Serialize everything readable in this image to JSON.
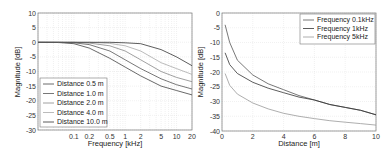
{
  "chart_data": [
    {
      "type": "line",
      "title": "",
      "xlabel": "Frequency [kHz]",
      "ylabel": "Magnitude [dB]",
      "xscale": "log",
      "xlim": [
        0.02,
        20
      ],
      "ylim": [
        -30,
        10
      ],
      "xticks": [
        "0.1",
        "0.2",
        "0.5",
        "1",
        "2",
        "5",
        "10",
        "20"
      ],
      "yticks": [
        "10",
        "5",
        "0",
        "-5",
        "-10",
        "-15",
        "-20",
        "-25",
        "-30"
      ],
      "grid": true,
      "legend_position": "lower left",
      "x": [
        0.02,
        0.05,
        0.1,
        0.2,
        0.5,
        1,
        2,
        5,
        10,
        20
      ],
      "series": [
        {
          "name": "Distance 0.5 m",
          "values": [
            0,
            -0.1,
            -0.5,
            -2,
            -5.5,
            -8.5,
            -11.5,
            -15,
            -16.5,
            -18
          ]
        },
        {
          "name": "Distance 1.0 m",
          "values": [
            0,
            0,
            -0.2,
            -0.8,
            -3,
            -6,
            -9,
            -12.5,
            -14.5,
            -16
          ]
        },
        {
          "name": "Distance 2.0 m",
          "values": [
            0,
            0,
            0,
            -0.3,
            -1.2,
            -3,
            -6,
            -10,
            -12,
            -13.5
          ]
        },
        {
          "name": "Distance 4.0 m",
          "values": [
            0,
            0,
            0,
            0,
            -0.4,
            -1.2,
            -3,
            -7,
            -9,
            -11
          ]
        },
        {
          "name": "Distance 10.0 m",
          "values": [
            0,
            0,
            0,
            0,
            0,
            -0.2,
            -0.5,
            -2.5,
            -5,
            -8
          ]
        }
      ]
    },
    {
      "type": "line",
      "title": "",
      "xlabel": "Distance [m]",
      "ylabel": "Magnitude [dB]",
      "xlim": [
        0,
        10
      ],
      "ylim": [
        -40,
        0
      ],
      "xticks": [
        "0",
        "2",
        "4",
        "6",
        "8",
        "10"
      ],
      "yticks": [
        "0",
        "-5",
        "-10",
        "-15",
        "-20",
        "-25",
        "-30",
        "-35",
        "-40"
      ],
      "grid": true,
      "legend_position": "upper right",
      "x": [
        0.2,
        0.5,
        1,
        2,
        3,
        4,
        5,
        6,
        7,
        8,
        9,
        10
      ],
      "series": [
        {
          "name": "Frequency 0.1kHz",
          "values": [
            -4,
            -10,
            -16,
            -21,
            -24,
            -26,
            -28,
            -29.5,
            -31,
            -32,
            -33,
            -34.5
          ]
        },
        {
          "name": "Frequency 1kHz",
          "values": [
            -13.5,
            -17.5,
            -20.5,
            -23.5,
            -25.5,
            -27,
            -28.5,
            -29.5,
            -31,
            -32,
            -33,
            -34.5
          ]
        },
        {
          "name": "Frequency 5kHz",
          "values": [
            -20.5,
            -24.5,
            -27.5,
            -30.5,
            -32.5,
            -34,
            -35,
            -35.8,
            -36.5,
            -37,
            -37.5,
            -38
          ]
        }
      ]
    }
  ],
  "left": {
    "xlabel": "Frequency [kHz]",
    "ylabel": "Magnitude [dB]",
    "xticks": [
      "0.1",
      "0.2",
      "0.5",
      "1",
      "2",
      "5",
      "10",
      "20"
    ],
    "yticks": [
      "10",
      "5",
      "0",
      "-5",
      "-10",
      "-15",
      "-20",
      "-25",
      "-30"
    ],
    "legend": [
      "Distance 0.5 m",
      "Distance 1.0 m",
      "Distance 2.0 m",
      "Distance 4.0 m",
      "Distance 10.0 m"
    ]
  },
  "right": {
    "xlabel": "Distance [m]",
    "ylabel": "Magnitude [dB]",
    "xticks": [
      "0",
      "2",
      "4",
      "6",
      "8",
      "10"
    ],
    "yticks": [
      "0",
      "-5",
      "-10",
      "-15",
      "-20",
      "-25",
      "-30",
      "-35",
      "-40"
    ],
    "legend": [
      "Frequency 0.1kHz",
      "Frequency 1kHz",
      "Frequency 5kHz"
    ]
  },
  "colors": {
    "left_series": [
      "#444444",
      "#555555",
      "#888888",
      "#aaaaaa",
      "#333333"
    ],
    "right_series": [
      "#555555",
      "#333333",
      "#999999"
    ],
    "grid": "#dcdcdc",
    "axis": "#555555"
  }
}
